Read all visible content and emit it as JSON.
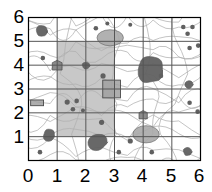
{
  "figure": {
    "type": "spatial-grid-map",
    "title": "",
    "background_color": "#ffffff"
  },
  "chart_data": {
    "type": "scatter",
    "title": "",
    "xlabel": "",
    "ylabel": "",
    "xlim": [
      0,
      6
    ],
    "ylim": [
      0,
      6
    ],
    "grid": true,
    "legend": "none",
    "x_ticks": [
      "0",
      "1",
      "2",
      "3",
      "4",
      "5",
      "6"
    ],
    "y_ticks": [
      "0",
      "1",
      "2",
      "3",
      "4",
      "5",
      "6"
    ],
    "x_tick_values": [
      0,
      1,
      2,
      3,
      4,
      5,
      6
    ],
    "y_tick_values": [
      0,
      1,
      2,
      3,
      4,
      5,
      6
    ],
    "colors": {
      "frame": "#000000",
      "gridline": "#555555",
      "highlight_region": "#9a9a9a",
      "blob_dark": "#606060",
      "blob_mid": "#808080",
      "blob_light": "#a8a8a8",
      "contour": "#b0b0b0",
      "rectangle_fill": "#a0a0a0",
      "rectangle_stroke": "#4a4a4a"
    },
    "highlight_region": {
      "x0": 1.0,
      "y0": 1.0,
      "x1": 3.0,
      "y1": 5.0,
      "fill": "#9a9a9a",
      "opacity": 0.55
    },
    "blobs": [
      {
        "x": 0.45,
        "y": 5.45,
        "r": 0.22,
        "shade": "dark"
      },
      {
        "x": 2.85,
        "y": 5.15,
        "r": 0.42,
        "shade": "light",
        "ellipse": true,
        "rx": 0.46,
        "ry": 0.28
      },
      {
        "x": 2.35,
        "y": 5.55,
        "r": 0.08,
        "shade": "dark"
      },
      {
        "x": 2.75,
        "y": 5.75,
        "r": 0.07,
        "shade": "dark"
      },
      {
        "x": 3.55,
        "y": 5.7,
        "r": 0.07,
        "shade": "dark"
      },
      {
        "x": 5.4,
        "y": 5.6,
        "r": 0.08,
        "shade": "dark"
      },
      {
        "x": 5.72,
        "y": 5.6,
        "r": 0.08,
        "shade": "dark"
      },
      {
        "x": 5.55,
        "y": 5.32,
        "r": 0.08,
        "shade": "dark"
      },
      {
        "x": 5.62,
        "y": 4.72,
        "r": 0.08,
        "shade": "dark"
      },
      {
        "x": 5.92,
        "y": 4.82,
        "r": 0.08,
        "shade": "dark"
      },
      {
        "x": 0.5,
        "y": 4.3,
        "r": 0.08,
        "shade": "dark"
      },
      {
        "x": 1.0,
        "y": 4.0,
        "r": 0.2,
        "shade": "mid",
        "shape": "blob-square"
      },
      {
        "x": 2.0,
        "y": 4.0,
        "r": 0.13,
        "shade": "dark"
      },
      {
        "x": 4.25,
        "y": 3.8,
        "r": 0.48,
        "shade": "dark"
      },
      {
        "x": 4.62,
        "y": 3.55,
        "r": 0.08,
        "shade": "dark"
      },
      {
        "x": 2.6,
        "y": 3.55,
        "r": 0.09,
        "shade": "dark"
      },
      {
        "x": 5.6,
        "y": 3.2,
        "r": 0.14,
        "shade": "dark"
      },
      {
        "x": 0.3,
        "y": 2.42,
        "shape": "rect",
        "w": 0.45,
        "h": 0.2,
        "shade": "light"
      },
      {
        "x": 2.9,
        "y": 3.0,
        "shape": "rect",
        "w": 0.62,
        "h": 0.62,
        "shade": "light"
      },
      {
        "x": 1.35,
        "y": 2.45,
        "r": 0.09,
        "shade": "dark"
      },
      {
        "x": 1.68,
        "y": 2.5,
        "r": 0.08,
        "shade": "dark"
      },
      {
        "x": 1.55,
        "y": 2.15,
        "r": 0.08,
        "shade": "dark"
      },
      {
        "x": 1.9,
        "y": 2.1,
        "r": 0.07,
        "shade": "dark"
      },
      {
        "x": 5.62,
        "y": 2.42,
        "r": 0.08,
        "shade": "dark"
      },
      {
        "x": 5.9,
        "y": 2.05,
        "r": 0.08,
        "shade": "dark"
      },
      {
        "x": 4.0,
        "y": 1.92,
        "r": 0.17,
        "shape": "blob-square",
        "shade": "mid"
      },
      {
        "x": 2.55,
        "y": 1.6,
        "r": 0.09,
        "shade": "dark"
      },
      {
        "x": 4.1,
        "y": 1.1,
        "r": 0.44,
        "shade": "light",
        "ellipse": true,
        "rx": 0.46,
        "ry": 0.3
      },
      {
        "x": 0.72,
        "y": 1.05,
        "r": 0.22,
        "shade": "dark"
      },
      {
        "x": 2.4,
        "y": 0.78,
        "r": 0.33,
        "shade": "dark"
      },
      {
        "x": 3.55,
        "y": 0.82,
        "r": 0.09,
        "shade": "dark"
      },
      {
        "x": 0.4,
        "y": 0.35,
        "r": 0.08,
        "shade": "dark"
      },
      {
        "x": 3.15,
        "y": 0.35,
        "r": 0.08,
        "shade": "dark"
      },
      {
        "x": 4.3,
        "y": 0.35,
        "r": 0.08,
        "shade": "dark"
      },
      {
        "x": 5.55,
        "y": 0.38,
        "r": 0.15,
        "shade": "dark"
      }
    ],
    "contour_count": 14
  },
  "axes": {
    "x": {
      "labels": [
        "0",
        "1",
        "2",
        "3",
        "4",
        "5",
        "6"
      ]
    },
    "y": {
      "labels": [
        "6",
        "5",
        "4",
        "3",
        "2",
        "1",
        "0"
      ]
    }
  }
}
